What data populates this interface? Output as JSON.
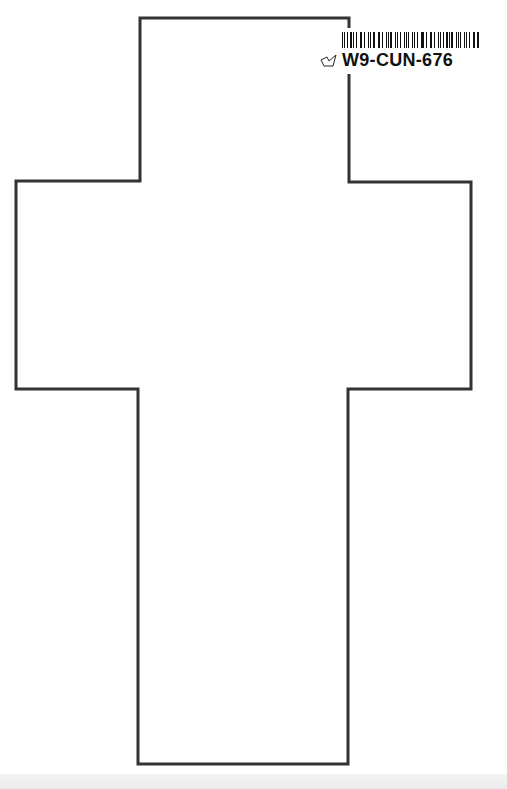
{
  "page": {
    "background": "#ffffff",
    "shape": "cross-outline"
  },
  "cross": {
    "stroke_color": "#333333",
    "stroke_width": 3,
    "points": [
      [
        140,
        18
      ],
      [
        349,
        18
      ],
      [
        349,
        182
      ],
      [
        471,
        182
      ],
      [
        471,
        389
      ],
      [
        348,
        389
      ],
      [
        348,
        764
      ],
      [
        138,
        764
      ],
      [
        138,
        389
      ],
      [
        16,
        389
      ],
      [
        16,
        181
      ],
      [
        140,
        181
      ]
    ]
  },
  "sticker": {
    "code": "W9-CUN-676",
    "icon": "book-icon"
  }
}
